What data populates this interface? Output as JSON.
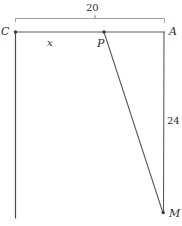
{
  "figure": {
    "type": "geometry-diagram",
    "background_color": "#ffffff",
    "stroke_color": "#4a4a4a",
    "text_color": "#2e2e2e",
    "vertices": [
      {
        "id": "C",
        "label": "C",
        "x": 15,
        "y": 32,
        "dot": true
      },
      {
        "id": "A",
        "label": "A",
        "x": 164,
        "y": 32,
        "dot": false
      },
      {
        "id": "P",
        "label": "P",
        "x": 104,
        "y": 32,
        "dot": true
      },
      {
        "id": "M",
        "label": "M",
        "x": 163,
        "y": 213,
        "dot": true
      }
    ],
    "segments": [
      {
        "id": "CA",
        "from": "C",
        "to": "A"
      },
      {
        "id": "AM",
        "from": "A",
        "to": "M"
      },
      {
        "id": "PM",
        "from": "P",
        "to": "M"
      },
      {
        "id": "C-down",
        "from": "C",
        "to": "C-bottom"
      }
    ],
    "measures": [
      {
        "id": "top-brace",
        "label": "20",
        "spans": "C to A",
        "position": "above"
      },
      {
        "id": "right-side",
        "label": "24",
        "spans": "A to M",
        "position": "right"
      },
      {
        "id": "segment-CP",
        "label": "x",
        "spans": "C to P",
        "position": "below"
      }
    ],
    "labels": {
      "C": "C",
      "A": "A",
      "P": "P",
      "M": "M",
      "x": "x",
      "twenty": "20",
      "twentyfour": "24"
    }
  }
}
